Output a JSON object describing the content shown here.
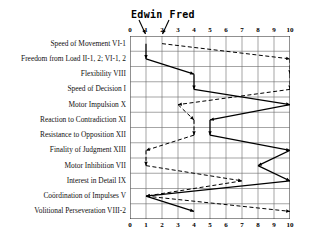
{
  "title": {
    "series_label_1": "Edwin",
    "series_label_2": "Fred"
  },
  "axis": {
    "ticks": [
      "0",
      "1",
      "2",
      "3",
      "4",
      "5",
      "6",
      "7",
      "8",
      "9",
      "10"
    ],
    "min": 0,
    "max": 10
  },
  "rows": [
    "Speed of Movement VI-1",
    "Freedom from Load II-1, 2; VI-1, 2",
    "Flexibility VIII",
    "Speed of Decision I",
    "Motor Impulsion X",
    "Reaction to Contradiction XI",
    "Resistance to Opposition XII",
    "Finality of Judgment XIII",
    "Motor Inhibition VII",
    "Interest in Detail IX",
    "Coördination of Impulses V",
    "Volitional Perseveration VIII-2"
  ],
  "chart_data": {
    "type": "line",
    "orientation": "vertical-categories",
    "xlabel": "",
    "ylabel": "",
    "xlim": [
      0,
      10
    ],
    "grid": true,
    "legend": "inline-callout-top",
    "categories": [
      "Speed of Movement VI-1",
      "Freedom from Load II-1, 2; VI-1, 2",
      "Flexibility VIII",
      "Speed of Decision I",
      "Motor Impulsion X",
      "Reaction to Contradiction XI",
      "Resistance to Opposition XII",
      "Finality of Judgment XIII",
      "Motor Inhibition VII",
      "Interest in Detail IX",
      "Coördination of Impulses V",
      "Volitional Perseveration VIII-2"
    ],
    "series": [
      {
        "name": "Edwin",
        "style": "solid",
        "color": "#000000",
        "values": [
          1,
          1,
          4,
          4,
          10,
          5,
          5,
          10,
          8,
          10,
          1,
          4
        ]
      },
      {
        "name": "Fred",
        "style": "dashed",
        "color": "#000000",
        "values": [
          2,
          10,
          10,
          10,
          3,
          4,
          4,
          1,
          1,
          7,
          1,
          10
        ]
      }
    ]
  }
}
